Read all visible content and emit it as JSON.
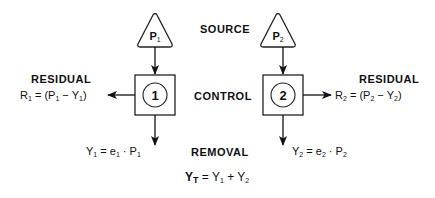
{
  "labels": {
    "source": "SOURCE",
    "control": "CONTROL",
    "removal": "REMOVAL",
    "residual_left": "RESIDUAL",
    "residual_right": "RESIDUAL"
  },
  "units": [
    {
      "id": 1,
      "source_symbol": "P",
      "source_sub": "1",
      "control_number": "1",
      "residual": {
        "lhs": "R",
        "lhs_sub": "1",
        "expr": "= (P",
        "p_sub": "1",
        "minus": " − Y",
        "y_sub": "1",
        "close": ")"
      },
      "removal": {
        "lhs": "Y",
        "lhs_sub": "1",
        "mid": " = e",
        "e_sub": "1",
        "dot": " · P",
        "p_sub": "1"
      }
    },
    {
      "id": 2,
      "source_symbol": "P",
      "source_sub": "2",
      "control_number": "2",
      "residual": {
        "lhs": "R",
        "lhs_sub": "2",
        "expr": "= (P",
        "p_sub": "2",
        "minus": " − Y",
        "y_sub": "2",
        "close": ")"
      },
      "removal": {
        "lhs": "Y",
        "lhs_sub": "2",
        "mid": " = e",
        "e_sub": "2",
        "dot": " · P",
        "p_sub": "2"
      }
    }
  ],
  "total": {
    "lhs": "Y",
    "lhs_sub": "T",
    "mid": " = Y",
    "s1": "1",
    "plus": " + Y",
    "s2": "2"
  }
}
